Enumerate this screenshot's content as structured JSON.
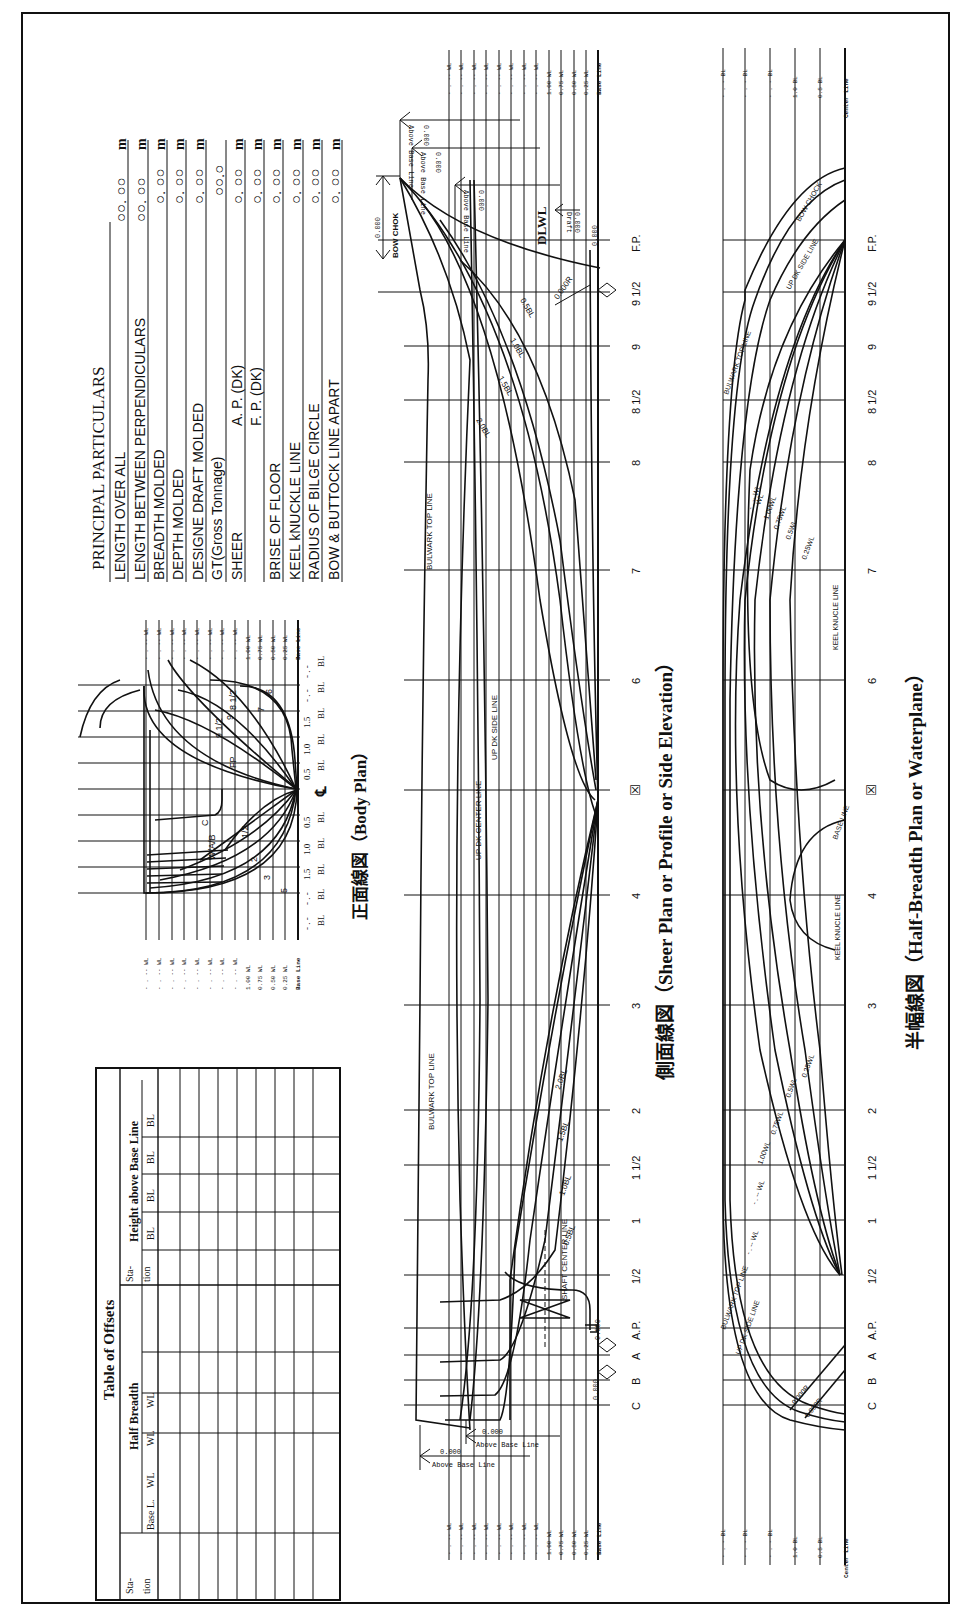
{
  "particulars": {
    "title": "PRINCIPAL PARTICULARS",
    "rows": [
      {
        "label": "LENGTH OVER ALL",
        "sub": "",
        "value": "○○. ○○",
        "unit": "m"
      },
      {
        "label": "LENGTH BETWEEN PERPENDICULARS",
        "sub": "",
        "value": "○○. ○○",
        "unit": "m"
      },
      {
        "label": "BREADTH MOLDED",
        "sub": "",
        "value": "○. ○○",
        "unit": "m"
      },
      {
        "label": "DEPTH MOLDED",
        "sub": "",
        "value": "○. ○○",
        "unit": "m"
      },
      {
        "label": "DESIGNE DRAFT MOLDED",
        "sub": "",
        "value": "○. ○○",
        "unit": "m"
      },
      {
        "label": "GT(Gross Tonnage)",
        "sub": "",
        "value": "○○.○",
        "unit": ""
      },
      {
        "label": "SHEER",
        "sub": "A. P. (DK)",
        "value": "○. ○○",
        "unit": "m"
      },
      {
        "label": "",
        "sub": "F. P. (DK)",
        "value": "○. ○○",
        "unit": "m"
      },
      {
        "label": "BRISE OF FLOOR",
        "sub": "",
        "value": "○. ○○",
        "unit": "m"
      },
      {
        "label": "KEEL kNUCKLE LINE",
        "sub": "",
        "value": "○. ○○",
        "unit": "m"
      },
      {
        "label": "RADIUS OF BILGE CIRCLE",
        "sub": "",
        "value": "○. ○○",
        "unit": "m"
      },
      {
        "label": "BOW & BUTTOCK LINE APART",
        "sub": "",
        "value": "○. ○○",
        "unit": "m"
      }
    ]
  },
  "body_plan": {
    "title": "正面線図（Body Plan）",
    "wl_labels": [
      "- . -- WL",
      "- . -- WL",
      "- . -- WL",
      "- . -- WL",
      "- . -- WL",
      "- . -- WL",
      "- . -- WL",
      "- . -- WL",
      "1.00 WL",
      "0.75 WL",
      "0.50 WL",
      "0.25 WL"
    ],
    "base_line": "Base Line",
    "bl_labels_left": [
      "- . -",
      "- . -",
      "1.5",
      "1.0",
      "0.5"
    ],
    "bl_labels_right": [
      "0.5",
      "1.0",
      "1.5",
      "- . -",
      "- . -"
    ],
    "bl_suffix": "BL",
    "centerline_symbol": "℄",
    "station_labels_fore": [
      "FP",
      "9 1/2",
      "9",
      "8 1/2",
      "8",
      "7",
      "6"
    ],
    "station_labels_aft": [
      "C",
      "B",
      "A",
      "AP",
      "1",
      "1/2",
      "2",
      "3",
      "4",
      "5"
    ]
  },
  "offsets_table": {
    "title": "Table of Offsets",
    "half_breadth_header": "Half Breadth",
    "height_header": "Height above Base Line",
    "station_header": "Sta-tion",
    "half_breadth_cols": [
      "Base L.",
      "WL",
      "WL",
      "WL",
      ""
    ],
    "height_cols": [
      "BL",
      "BL",
      "BL",
      "BL",
      ""
    ],
    "row_count": 10
  },
  "sheer_plan": {
    "title": "側面線図（Sheer Plan or Profile or Side Elevation）",
    "stations": [
      "F.P.",
      "9 1/2",
      "9",
      "8 1/2",
      "8",
      "7",
      "6",
      "☒",
      "4",
      "3",
      "2",
      "1 1/2",
      "1",
      "1/2",
      "A.P.",
      "A",
      "B",
      "C"
    ],
    "wl_labels": [
      "- . -- WL",
      "- . -- WL",
      "- . -- WL",
      "- . -- WL",
      "- . -- WL",
      "- . -- WL",
      "- . -- WL",
      "- . -- WL",
      "1.00 WL",
      "0.75 WL",
      "0.50 WL",
      "0.25 WL"
    ],
    "base_line": "Base Line",
    "labels": {
      "bulwark_top_fwd": "BULWARK TOP LINE",
      "bulwark_top_aft": "BULWARK TOP LINE",
      "up_dk_center": "UP DK CENTER LINE",
      "up_dk_side": "UP DK SIDE LINE",
      "shaft_center": "SHAFT CENTER LINE",
      "bow_chok": "BOW CHOK",
      "dlwl": "DLWL",
      "bl_fwd": [
        "0.5BL",
        "1.0BL",
        "1.5BL",
        "2.0BL"
      ],
      "bl_aft": [
        "0.5BL",
        "1.0BL",
        "1.5BL",
        "2.0BL"
      ],
      "radius": "0.000R"
    },
    "dims": {
      "bow_chok_height": "0.000",
      "above_base_1": "0.000",
      "above_base_2": "0.000",
      "above_base_3": "0.000",
      "draft": "0.000",
      "draft_label": "Draft",
      "above_base_label": "Above Base Line",
      "fp_dim": "0.000",
      "aft_above_1": "0.000",
      "aft_above_2": "0.000",
      "ap_dim": "0.000",
      "a_dim": "0.000",
      "b_dim": "0.000"
    }
  },
  "half_breadth_plan": {
    "title": "半幅線図（Half-Breadth Plan or Waterplane）",
    "stations": [
      "F.P.",
      "9 1/2",
      "9",
      "8 1/2",
      "8",
      "7",
      "6",
      "☒",
      "4",
      "3",
      "2",
      "1 1/2",
      "1",
      "1/2",
      "A.P.",
      "A",
      "B",
      "C"
    ],
    "bl_labels": [
      "- . - BL",
      "- . - BL",
      "- . - BL",
      "1.0 BL",
      "0.5 BL"
    ],
    "center_line": "Center Line",
    "labels": {
      "bow_chock": "BOW CHOCK",
      "up_dk_side_fwd": "UP DK SIDE LINE",
      "bulwark_fwd": "BULWARK TOP LINE",
      "keel_knuckle_fwd": "KEEL KNUCLE LINE",
      "keel_knuckle_aft": "KEEL KNUCLE LINE",
      "base_line": "BASE LINE",
      "bulwark_aft": "BULWARK TOP LINE",
      "up_dk_side_aft": "UP DK SIDE LINE",
      "wl_fwd": [
        "- . -- WL",
        "WL",
        "1.00WL",
        "0.75WL",
        "0.5WL",
        "0.25WL"
      ],
      "wl_aft": [
        "- . -- WL",
        "- . -- WL",
        "1.00WL",
        "0.75WL",
        "0.5WL",
        "0.25WL"
      ],
      "radius_1": "0.000R",
      "radius_2": "0.000R"
    }
  }
}
